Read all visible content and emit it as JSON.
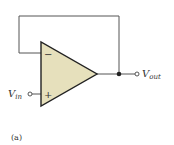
{
  "diagram": {
    "caption": "(a)",
    "opamp": {
      "inverting_symbol": "−",
      "noninverting_symbol": "+",
      "fill_color": "#e6e0bc",
      "stroke_color": "#222222"
    },
    "input": {
      "label_main": "V",
      "label_sub": "in"
    },
    "output": {
      "label_main": "V",
      "label_sub": "out"
    },
    "wire_color": "#555555"
  }
}
